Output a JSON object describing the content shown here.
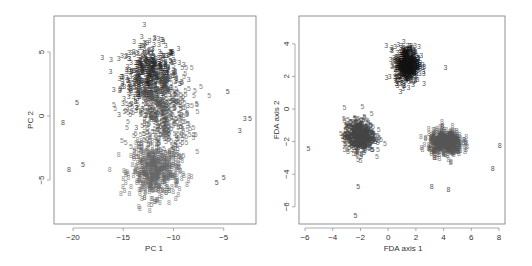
{
  "chart_data": [
    {
      "type": "scatter",
      "title": "",
      "xlabel": "PC 1",
      "ylabel": "PC 2",
      "xlim": [
        -22,
        -2
      ],
      "ylim": [
        -8.5,
        7.8
      ],
      "xticks": [
        -20,
        -15,
        -10,
        -5
      ],
      "yticks": [
        -5,
        0,
        5
      ],
      "grid": false,
      "legend": "none (points plotted as digit labels 3, 5, 8)",
      "series": [
        {
          "name": "3",
          "color": "#222222",
          "center": [
            -12.5,
            3.0
          ],
          "spread": [
            2.5,
            2.2
          ],
          "n": 500
        },
        {
          "name": "5",
          "color": "#555555",
          "center": [
            -11.5,
            0.0
          ],
          "spread": [
            2.8,
            3.2
          ],
          "n": 500
        },
        {
          "name": "8",
          "color": "#666666",
          "center": [
            -12.0,
            -4.5
          ],
          "spread": [
            2.2,
            1.8
          ],
          "n": 500
        }
      ],
      "outliers": [
        {
          "label": "8",
          "x": -21.2,
          "y": -0.7
        },
        {
          "label": "8",
          "x": -20.6,
          "y": -4.4
        },
        {
          "label": "5",
          "x": -19.2,
          "y": -4.0
        },
        {
          "label": "5",
          "x": -19.8,
          "y": 0.9
        },
        {
          "label": "3",
          "x": -3.6,
          "y": -1.3
        },
        {
          "label": "3",
          "x": -3.1,
          "y": -0.4
        },
        {
          "label": "5",
          "x": -2.6,
          "y": -0.4
        },
        {
          "label": "5",
          "x": -4.8,
          "y": 1.7
        },
        {
          "label": "5",
          "x": -5.9,
          "y": -5.4
        },
        {
          "label": "5",
          "x": -5.2,
          "y": -5.0
        }
      ]
    },
    {
      "type": "scatter",
      "title": "",
      "xlabel": "FDA axis 1",
      "ylabel": "FDA axis 2",
      "xlim": [
        -6.4,
        8.4
      ],
      "ylim": [
        -7.1,
        5.7
      ],
      "xticks": [
        -6,
        -4,
        -2,
        0,
        2,
        4,
        6,
        8
      ],
      "yticks": [
        -6,
        -4,
        -2,
        0,
        2,
        4
      ],
      "grid": false,
      "legend": "none (points plotted as digit labels 3, 5, 8)",
      "series": [
        {
          "name": "3",
          "color": "#111111",
          "center": [
            1.2,
            2.6
          ],
          "spread": [
            0.8,
            1.0
          ],
          "n": 500
        },
        {
          "name": "5",
          "color": "#444444",
          "center": [
            -2.2,
            -1.8
          ],
          "spread": [
            1.0,
            0.9
          ],
          "n": 500
        },
        {
          "name": "8",
          "color": "#555555",
          "center": [
            4.0,
            -2.2
          ],
          "spread": [
            1.1,
            0.7
          ],
          "n": 500
        }
      ],
      "outliers": [
        {
          "label": "5",
          "x": -5.9,
          "y": -2.6
        },
        {
          "label": "5",
          "x": -2.5,
          "y": -6.7
        },
        {
          "label": "5",
          "x": -2.3,
          "y": -4.9
        },
        {
          "label": "3",
          "x": 4.0,
          "y": 2.4
        },
        {
          "label": "8",
          "x": 7.9,
          "y": -2.4
        },
        {
          "label": "8",
          "x": 7.4,
          "y": -3.8
        },
        {
          "label": "8",
          "x": 3.0,
          "y": -4.9
        },
        {
          "label": "8",
          "x": 4.2,
          "y": -5.1
        }
      ]
    }
  ]
}
